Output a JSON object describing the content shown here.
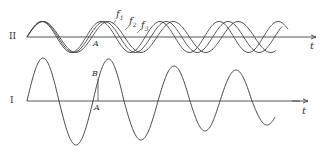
{
  "chart_data": {
    "type": "line",
    "panels": [
      {
        "id": "II",
        "label": "II",
        "axis_label": "t",
        "description": "Three superimposed sinusoids of slightly different frequency f1 < f2 < f3 that progressively drift out of phase",
        "series": [
          {
            "name": "f1",
            "label": "f",
            "subscript": "1",
            "frequency_rel": 1.0
          },
          {
            "name": "f2",
            "label": "f",
            "subscript": "2",
            "frequency_rel": 1.05
          },
          {
            "name": "f3",
            "label": "f",
            "subscript": "3",
            "frequency_rel": 1.1
          }
        ],
        "annotations": [
          {
            "text": "A",
            "position": "at zero crossing after first trough"
          }
        ]
      },
      {
        "id": "I",
        "label": "I",
        "axis_label": "t",
        "description": "Single oscillation with decaying amplitude (sum of the components in II)",
        "series": [
          {
            "name": "resultant",
            "peaks": [
              58,
              59,
              66,
              70
            ],
            "troughs": [
              145,
              140,
              131,
              125
            ]
          }
        ],
        "annotations": [
          {
            "text": "B",
            "position": "on rising slope above A"
          },
          {
            "text": "A",
            "position": "on axis below B"
          }
        ]
      }
    ]
  },
  "labels": {
    "panel_top": "II",
    "panel_bottom": "I",
    "t_top": "t",
    "t_bottom": "t",
    "A_top": "A",
    "A_bottom": "A",
    "B": "B",
    "f": "f",
    "f1_sub": "1",
    "f2_sub": "2",
    "f3_sub": "3"
  },
  "colors": {
    "ink": "#333333",
    "background": "#ffffff"
  }
}
